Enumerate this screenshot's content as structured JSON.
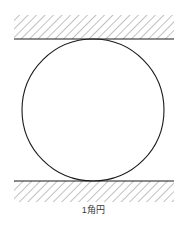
{
  "figure": {
    "caption": "1角円",
    "background_color": "#ffffff",
    "line_color": "#1a1a1a",
    "hatch_color": "#8d8d8d",
    "caption_color": "#3a3a3a",
    "width": 187,
    "height": 231
  },
  "diagram_elements": {
    "circle": {
      "label": "circle",
      "center_x": 93,
      "center_y": 110,
      "radius": 71,
      "stroke_color": "#1a1a1a",
      "stroke_width": 1.1,
      "fill": "none"
    },
    "upper_surface": {
      "label": "upper-hatched-surface",
      "line_y": 39,
      "line_x_start": 14,
      "line_x_end": 174,
      "hatch_top": 15,
      "hatch_bottom": 39,
      "hatch_angle_deg": 45
    },
    "lower_surface": {
      "label": "lower-hatched-surface",
      "line_y": 181,
      "line_x_start": 14,
      "line_x_end": 174,
      "hatch_top": 181,
      "hatch_bottom": 202,
      "hatch_angle_deg": 45
    },
    "tangent_points": {
      "top": {
        "x": 93,
        "y": 39
      },
      "bottom": {
        "x": 93,
        "y": 181
      }
    }
  }
}
